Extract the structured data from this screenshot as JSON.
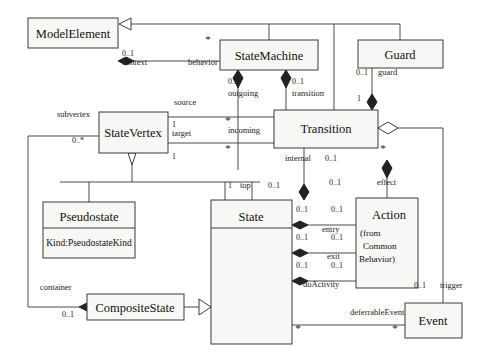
{
  "diagram": {
    "type": "uml-class-diagram",
    "classes": [
      {
        "id": "model_element",
        "name": "ModelElement",
        "x": 28,
        "y": 18,
        "w": 90,
        "h": 30,
        "attributes": []
      },
      {
        "id": "state_machine",
        "name": "StateMachine",
        "x": 220,
        "y": 40,
        "w": 98,
        "h": 30,
        "attributes": []
      },
      {
        "id": "guard",
        "name": "Guard",
        "x": 358,
        "y": 40,
        "w": 85,
        "h": 28,
        "attributes": []
      },
      {
        "id": "state_vertex",
        "name": "StateVertex",
        "x": 99,
        "y": 112,
        "w": 69,
        "h": 41,
        "attributes": []
      },
      {
        "id": "transition",
        "name": "Transition",
        "x": 274,
        "y": 110,
        "w": 104,
        "h": 38,
        "attributes": []
      },
      {
        "id": "pseudostate",
        "name": "Pseudostate",
        "x": 43,
        "y": 202,
        "w": 92,
        "h": 56,
        "attributes": [
          "Kind:PseudostateKind"
        ]
      },
      {
        "id": "state",
        "name": "State",
        "x": 211,
        "y": 200,
        "w": 81,
        "h": 144,
        "attributes": []
      },
      {
        "id": "action",
        "name": "Action",
        "x": 356,
        "y": 198,
        "w": 62,
        "h": 90,
        "subtitle": [
          "(from",
          "Common",
          "Behavior)"
        ]
      },
      {
        "id": "composite_state",
        "name": "CompositeState",
        "x": 87,
        "y": 294,
        "w": 97,
        "h": 26,
        "attributes": []
      },
      {
        "id": "event",
        "name": "Event",
        "x": 405,
        "y": 303,
        "w": 57,
        "h": 35,
        "attributes": []
      }
    ],
    "role_labels": [
      {
        "id": "context",
        "text": "context",
        "x": 122,
        "y": 65
      },
      {
        "id": "behavior",
        "text": "behavior",
        "x": 188,
        "y": 65
      },
      {
        "id": "outgoing",
        "text": "outgoing",
        "x": 228,
        "y": 96
      },
      {
        "id": "transition_role",
        "text": "transition",
        "x": 292,
        "y": 96
      },
      {
        "id": "guard_role",
        "text": "guard",
        "x": 378,
        "y": 75
      },
      {
        "id": "source",
        "text": "source",
        "x": 174,
        "y": 105
      },
      {
        "id": "subvertex",
        "text": "subvertex",
        "x": 57,
        "y": 117
      },
      {
        "id": "target",
        "text": "target",
        "x": 172,
        "y": 136
      },
      {
        "id": "incoming",
        "text": "incoming",
        "x": 228,
        "y": 133
      },
      {
        "id": "internal",
        "text": "internal",
        "x": 285,
        "y": 161
      },
      {
        "id": "effect",
        "text": "effect",
        "x": 377,
        "y": 185
      },
      {
        "id": "top",
        "text": "top",
        "x": 240,
        "y": 188
      },
      {
        "id": "entry",
        "text": "entry",
        "x": 322,
        "y": 232
      },
      {
        "id": "exit",
        "text": "exit",
        "x": 327,
        "y": 259
      },
      {
        "id": "doActivity",
        "text": "doActivity",
        "x": 303,
        "y": 287
      },
      {
        "id": "container",
        "text": "container",
        "x": 40,
        "y": 290
      },
      {
        "id": "trigger",
        "text": "trigger",
        "x": 440,
        "y": 288
      },
      {
        "id": "deferrableEvent",
        "text": "deferrableEvent",
        "x": 350,
        "y": 315
      }
    ],
    "multiplicities": [
      {
        "id": "me-gen-01",
        "text": "0..1",
        "x": 122,
        "y": 56
      },
      {
        "id": "sm-behavior",
        "text": "*",
        "x": 208,
        "y": 43,
        "big": true
      },
      {
        "id": "sm-outgoing",
        "text": "0..1",
        "x": 228,
        "y": 84
      },
      {
        "id": "sm-transition",
        "text": "0..1",
        "x": 292,
        "y": 84
      },
      {
        "id": "guard-01",
        "text": "0..1",
        "x": 356,
        "y": 75
      },
      {
        "id": "guard-1",
        "text": "1",
        "x": 357,
        "y": 101
      },
      {
        "id": "sv-target-1",
        "text": "1",
        "x": 172,
        "y": 127
      },
      {
        "id": "sv-sub-0n",
        "text": "0..*",
        "x": 72,
        "y": 143
      },
      {
        "id": "sv-bot-1",
        "text": "1",
        "x": 172,
        "y": 159
      },
      {
        "id": "tr-incoming",
        "text": "*",
        "x": 228,
        "y": 124,
        "big": true
      },
      {
        "id": "tr-internal",
        "text": "*",
        "x": 228,
        "y": 152,
        "big": true
      },
      {
        "id": "tr-trigger",
        "text": "*",
        "x": 383,
        "y": 152,
        "big": true
      },
      {
        "id": "int-01",
        "text": "0..1",
        "x": 325,
        "y": 161
      },
      {
        "id": "effect-01",
        "text": "0..1",
        "x": 329,
        "y": 185
      },
      {
        "id": "top-1",
        "text": "1",
        "x": 228,
        "y": 188
      },
      {
        "id": "top-01",
        "text": "0..1",
        "x": 268,
        "y": 188
      },
      {
        "id": "entry-l",
        "text": "0..1",
        "x": 296,
        "y": 212
      },
      {
        "id": "entry-r",
        "text": "0..1",
        "x": 331,
        "y": 212
      },
      {
        "id": "exit-l",
        "text": "0..1",
        "x": 296,
        "y": 240
      },
      {
        "id": "exit-r",
        "text": "0..1",
        "x": 331,
        "y": 240
      },
      {
        "id": "do-l",
        "text": "0..1",
        "x": 296,
        "y": 268
      },
      {
        "id": "do-r",
        "text": "0..1",
        "x": 331,
        "y": 268
      },
      {
        "id": "trig-01",
        "text": "0..1",
        "x": 414,
        "y": 288
      },
      {
        "id": "cont-01",
        "text": "0..1",
        "x": 62,
        "y": 317
      },
      {
        "id": "defer-state",
        "text": "*",
        "x": 298,
        "y": 332,
        "big": true
      },
      {
        "id": "defer-event",
        "text": "*",
        "x": 395,
        "y": 332,
        "big": true
      }
    ],
    "colors": {
      "box_fill": "#f7f7f5",
      "stroke": "#3a3a3a",
      "diamond_filled": "#222222",
      "background": "#ffffff"
    }
  }
}
